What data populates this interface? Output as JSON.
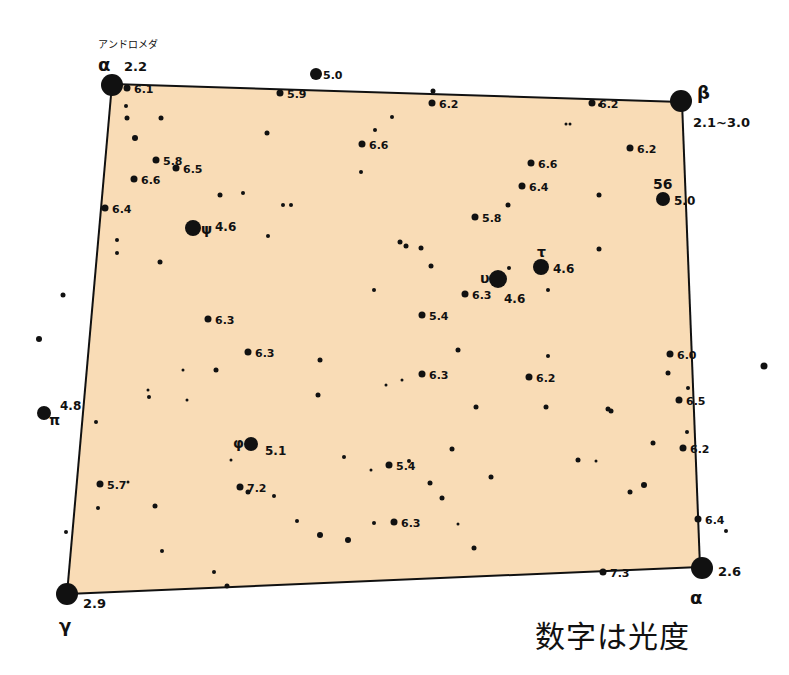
{
  "constellation_label": "アンドロメダ",
  "legend_note": "数字は光度",
  "colors": {
    "fill": "#f9dcb6",
    "ink": "#111111",
    "background": "#ffffff"
  },
  "square_corners": [
    [
      112,
      84
    ],
    [
      682,
      102
    ],
    [
      700,
      567
    ],
    [
      67,
      594
    ]
  ],
  "corner_stars": [
    {
      "greek": "α",
      "note": "Andromeda α (Alpheratz)",
      "mag": "2.2",
      "x": 112,
      "y": 85,
      "r": 11
    },
    {
      "greek": "β",
      "mag": "2.1~3.0",
      "x": 681,
      "y": 101,
      "r": 11
    },
    {
      "greek": "α",
      "mag": "2.6",
      "x": 702,
      "y": 568,
      "r": 11
    },
    {
      "greek": "γ",
      "mag": "2.9",
      "x": 67,
      "y": 594,
      "r": 11
    }
  ],
  "named_stars": [
    {
      "greek": "ψ",
      "mag": "4.6",
      "x": 193,
      "y": 228,
      "r": 8
    },
    {
      "greek": "υ",
      "mag": "4.6",
      "x": 498,
      "y": 279,
      "r": 9
    },
    {
      "greek": "τ",
      "mag": "4.6",
      "x": 541,
      "y": 267,
      "r": 8
    },
    {
      "greek": "π",
      "mag": "4.8",
      "x": 44,
      "y": 413,
      "r": 7
    },
    {
      "greek": "φ",
      "mag": "5.1",
      "x": 251,
      "y": 444,
      "r": 7
    },
    {
      "greek": "56",
      "mag": "5.0",
      "x": 663,
      "y": 199,
      "r": 7
    }
  ],
  "labeled_stars": [
    {
      "mag": "6.1",
      "x": 127,
      "y": 88
    },
    {
      "mag": "5.0",
      "x": 316,
      "y": 74
    },
    {
      "mag": "5.9",
      "x": 280,
      "y": 93
    },
    {
      "mag": "6.2",
      "x": 432,
      "y": 103
    },
    {
      "mag": "6.2",
      "x": 592,
      "y": 103
    },
    {
      "mag": "6.6",
      "x": 362,
      "y": 144
    },
    {
      "mag": "6.2",
      "x": 630,
      "y": 148
    },
    {
      "mag": "5.8",
      "x": 156,
      "y": 160
    },
    {
      "mag": "6.5",
      "x": 176,
      "y": 168
    },
    {
      "mag": "6.6",
      "x": 134,
      "y": 179
    },
    {
      "mag": "6.6",
      "x": 531,
      "y": 163
    },
    {
      "mag": "6.4",
      "x": 522,
      "y": 186
    },
    {
      "mag": "6.4",
      "x": 105,
      "y": 208
    },
    {
      "mag": "5.8",
      "x": 475,
      "y": 217
    },
    {
      "mag": "6.3",
      "x": 465,
      "y": 294
    },
    {
      "mag": "5.4",
      "x": 422,
      "y": 315
    },
    {
      "mag": "6.3",
      "x": 208,
      "y": 319
    },
    {
      "mag": "6.3",
      "x": 248,
      "y": 352
    },
    {
      "mag": "6.0",
      "x": 670,
      "y": 354
    },
    {
      "mag": "6.3",
      "x": 422,
      "y": 374
    },
    {
      "mag": "6.2",
      "x": 529,
      "y": 377
    },
    {
      "mag": "6.5",
      "x": 679,
      "y": 400
    },
    {
      "mag": "6.2",
      "x": 683,
      "y": 448
    },
    {
      "mag": "5.4",
      "x": 389,
      "y": 465
    },
    {
      "mag": "7.2",
      "x": 240,
      "y": 487
    },
    {
      "mag": "5.7",
      "x": 100,
      "y": 484
    },
    {
      "mag": "6.3",
      "x": 394,
      "y": 522
    },
    {
      "mag": "6.4",
      "x": 698,
      "y": 519
    },
    {
      "mag": "7.3",
      "x": 603,
      "y": 572
    }
  ],
  "dots": [
    [
      126,
      106,
      2
    ],
    [
      127,
      118,
      2.5
    ],
    [
      161,
      118,
      2.5
    ],
    [
      267,
      133,
      2.5
    ],
    [
      392,
      117,
      2
    ],
    [
      375,
      130,
      2
    ],
    [
      433,
      91,
      2.5
    ],
    [
      600,
      105,
      2
    ],
    [
      566,
      124,
      1.5
    ],
    [
      570,
      124,
      1.5
    ],
    [
      135,
      138,
      3
    ],
    [
      220,
      195,
      2.5
    ],
    [
      243,
      193,
      2
    ],
    [
      283,
      205,
      2
    ],
    [
      291,
      205,
      2
    ],
    [
      268,
      236,
      2
    ],
    [
      117,
      240,
      2
    ],
    [
      117,
      253,
      2
    ],
    [
      160,
      262,
      2.5
    ],
    [
      361,
      172,
      2
    ],
    [
      599,
      195,
      2.5
    ],
    [
      508,
      205,
      2.5
    ],
    [
      400,
      242,
      2.5
    ],
    [
      406,
      246,
      2.5
    ],
    [
      421,
      248,
      2.5
    ],
    [
      431,
      266,
      2.5
    ],
    [
      509,
      268,
      2
    ],
    [
      599,
      249,
      2.5
    ],
    [
      548,
      290,
      2
    ],
    [
      374,
      290,
      2
    ],
    [
      63,
      295,
      2.5
    ],
    [
      39,
      339,
      3
    ],
    [
      764,
      366,
      3.5
    ],
    [
      320,
      360,
      2.5
    ],
    [
      216,
      370,
      2.5
    ],
    [
      183,
      370,
      1.5
    ],
    [
      148,
      390,
      1.5
    ],
    [
      402,
      380,
      1.5
    ],
    [
      386,
      385,
      1.5
    ],
    [
      318,
      395,
      2.5
    ],
    [
      458,
      350,
      2.5
    ],
    [
      548,
      356,
      2
    ],
    [
      546,
      407,
      2.5
    ],
    [
      476,
      407,
      2.5
    ],
    [
      668,
      373,
      2.5
    ],
    [
      688,
      388,
      2
    ],
    [
      608,
      409,
      2.5
    ],
    [
      611,
      411,
      2.5
    ],
    [
      653,
      443,
      2.5
    ],
    [
      687,
      432,
      2
    ],
    [
      96,
      422,
      2
    ],
    [
      149,
      397,
      2
    ],
    [
      187,
      400,
      1.5
    ],
    [
      231,
      460,
      1.5
    ],
    [
      248,
      492,
      2.5
    ],
    [
      274,
      496,
      2
    ],
    [
      128,
      482,
      1.5
    ],
    [
      98,
      508,
      2
    ],
    [
      155,
      506,
      2.5
    ],
    [
      297,
      521,
      2
    ],
    [
      344,
      457,
      2
    ],
    [
      371,
      470,
      1.5
    ],
    [
      409,
      461,
      2
    ],
    [
      430,
      483,
      2.5
    ],
    [
      442,
      498,
      2.5
    ],
    [
      452,
      449,
      2.5
    ],
    [
      578,
      460,
      2.5
    ],
    [
      596,
      461,
      1.5
    ],
    [
      644,
      485,
      3
    ],
    [
      491,
      477,
      2.5
    ],
    [
      320,
      535,
      3
    ],
    [
      458,
      524,
      1.5
    ],
    [
      474,
      548,
      2.5
    ],
    [
      630,
      492,
      2.5
    ],
    [
      726,
      531,
      2
    ],
    [
      162,
      551,
      2
    ],
    [
      214,
      572,
      2
    ],
    [
      227,
      586,
      2.5
    ],
    [
      374,
      523,
      2
    ],
    [
      348,
      540,
      3
    ],
    [
      66,
      532,
      2
    ]
  ]
}
